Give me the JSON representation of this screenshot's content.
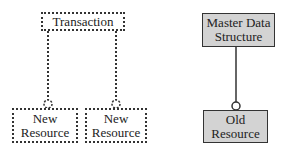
{
  "diagram": {
    "left": {
      "parent": {
        "label": "Transaction",
        "style": "dotted"
      },
      "children": [
        {
          "label_line1": "New",
          "label_line2": "Resource",
          "style": "dotted"
        },
        {
          "label_line1": "New",
          "label_line2": "Resource",
          "style": "dotted"
        }
      ],
      "connector": "dotted-line-with-optional-circle"
    },
    "right": {
      "parent": {
        "label_line1": "Master Data",
        "label_line2": "Structure",
        "style": "solid-shaded"
      },
      "child": {
        "label_line1": "Old",
        "label_line2": "Resource",
        "style": "solid-shaded"
      },
      "connector": "solid-line-with-optional-circle"
    },
    "colors": {
      "line": "#333333",
      "shaded_fill": "#d3d3d3",
      "background": "#ffffff"
    }
  }
}
